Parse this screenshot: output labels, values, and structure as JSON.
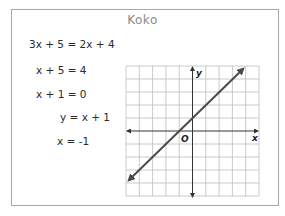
{
  "title": "Koko",
  "steps": [
    "3x + 5 = 2x + 4",
    "x + 5 = 4",
    "x + 1 = 0",
    "y = x + 1",
    "x = -1"
  ],
  "graph": {
    "x_axis_label": "x",
    "y_axis_label": "y",
    "origin_label": "O",
    "line_equation": "y = x + 1",
    "grid_size": 10
  },
  "colors": {
    "border": "#a8a8a8",
    "title": "#8a8a8a",
    "grid": "#bdbdbd",
    "line": "#4a4a4a"
  }
}
